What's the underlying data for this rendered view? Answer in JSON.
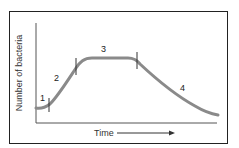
{
  "diagram": {
    "y_axis_label": "Number of bacteria",
    "x_axis_label": "Time",
    "phase_labels": [
      "1",
      "2",
      "3",
      "4"
    ],
    "colors": {
      "curve": "#8a8a8a",
      "axes": "#444444",
      "frame": "#222222"
    }
  }
}
